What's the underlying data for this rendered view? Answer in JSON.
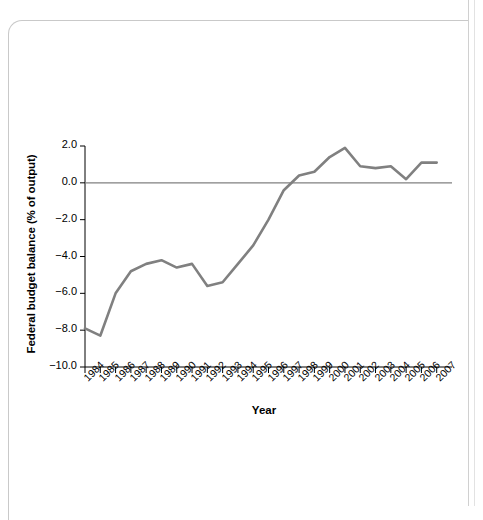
{
  "page": {
    "background_color": "#ffffff",
    "sheet_border_color": "#c9c9c9"
  },
  "chart_data": {
    "type": "line",
    "title": "",
    "xlabel": "Year",
    "ylabel": "Federal budget balance (% of output)",
    "categories": [
      "1984",
      "1985",
      "1986",
      "1987",
      "1988",
      "1989",
      "1990",
      "1991",
      "1992",
      "1993",
      "1994",
      "1995",
      "1996",
      "1997",
      "1998",
      "1999",
      "2000",
      "2001",
      "2002",
      "2003",
      "2004",
      "2005",
      "2006",
      "2007"
    ],
    "values": [
      -7.9,
      -8.3,
      -6.0,
      -4.8,
      -4.4,
      -4.2,
      -4.6,
      -4.4,
      -5.6,
      -5.4,
      -4.4,
      -3.4,
      -2.0,
      -0.4,
      0.4,
      0.6,
      1.4,
      1.9,
      0.9,
      0.8,
      0.9,
      0.2,
      1.1,
      1.1
    ],
    "ylim": [
      -10.0,
      2.0
    ],
    "yticks": [
      2.0,
      0.0,
      -2.0,
      -4.0,
      -6.0,
      -8.0,
      -10.0
    ],
    "ytick_labels": [
      "2.0",
      "0.0",
      "−2.0",
      "−4.0",
      "−6.0",
      "−8.0",
      "−10.0"
    ],
    "grid": false,
    "legend": "none",
    "series_color": "#808080",
    "axis_color": "#000000",
    "zero_line_color": "#808080",
    "line_width_px": 2.6
  }
}
